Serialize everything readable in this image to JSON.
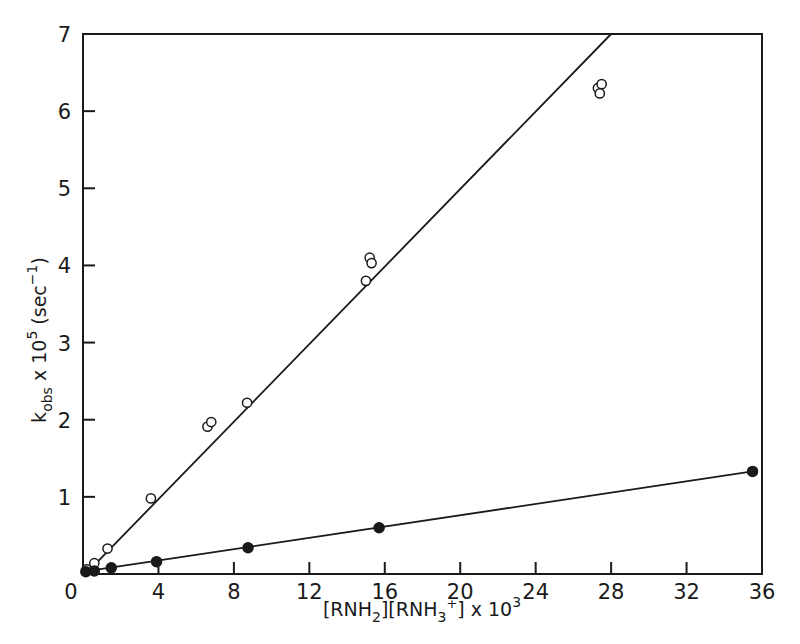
{
  "chart_data": {
    "type": "scatter",
    "title": "",
    "xlabel": "[RNH2][RNH3+] x 10^3",
    "ylabel": "k_obs x 10^5 (sec^-1)",
    "xlim": [
      0,
      36
    ],
    "ylim": [
      0,
      7
    ],
    "xticks": [
      0,
      4,
      8,
      12,
      16,
      20,
      24,
      28,
      32,
      36
    ],
    "yticks": [
      0,
      1,
      2,
      3,
      4,
      5,
      6,
      7
    ],
    "grid": false,
    "legend": null,
    "series": [
      {
        "name": "open circles",
        "marker": "open-circle",
        "points": [
          [
            0.2,
            0.06
          ],
          [
            0.6,
            0.14
          ],
          [
            1.3,
            0.33
          ],
          [
            3.6,
            0.98
          ],
          [
            6.6,
            1.91
          ],
          [
            6.8,
            1.97
          ],
          [
            8.7,
            2.22
          ],
          [
            15.0,
            3.8
          ],
          [
            15.2,
            4.1
          ],
          [
            15.3,
            4.03
          ],
          [
            27.3,
            6.3
          ],
          [
            27.5,
            6.35
          ],
          [
            27.4,
            6.23
          ]
        ],
        "fit_line": [
          [
            0.3,
            0.04
          ],
          [
            28.0,
            7.0
          ]
        ]
      },
      {
        "name": "filled circles",
        "marker": "filled-circle",
        "points": [
          [
            0.15,
            0.03
          ],
          [
            0.6,
            0.04
          ],
          [
            1.5,
            0.08
          ],
          [
            3.9,
            0.16
          ],
          [
            8.75,
            0.34
          ],
          [
            15.7,
            0.6
          ],
          [
            35.5,
            1.33
          ]
        ],
        "fit_line": [
          [
            0.3,
            0.04
          ],
          [
            35.5,
            1.33
          ]
        ]
      }
    ]
  },
  "axes": {
    "x_tick_labels": [
      "0",
      "4",
      "8",
      "12",
      "16",
      "20",
      "24",
      "28",
      "32",
      "36"
    ],
    "y_tick_labels": [
      "0",
      "1",
      "2",
      "3",
      "4",
      "5",
      "6",
      "7"
    ],
    "xlabel_parts": {
      "a": "[RNH",
      "a_sub": "2",
      "b": "][RNH",
      "b_sub": "3",
      "b_sup": "+",
      "c": "] x 10",
      "c_sup": "3"
    },
    "ylabel_parts": {
      "a": "k",
      "a_sub": "obs",
      "b": " x 10",
      "b_sup": "5",
      "c": " (sec",
      "c_sup": "−1",
      "d": ")"
    }
  }
}
